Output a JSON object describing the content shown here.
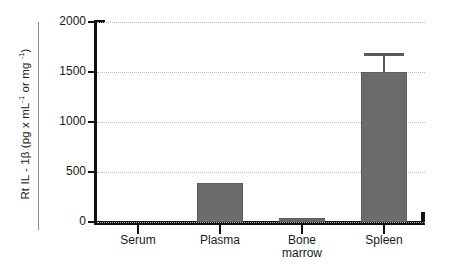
{
  "chart_data": {
    "type": "bar",
    "title": "",
    "subtitle": "",
    "xlabel": "",
    "ylabel": "Rt IL - 1β  (pg x mL⁻¹ or mg ⁻¹)",
    "ylabel_parts": {
      "main": "Rt IL - 1β  (pg x mL",
      "sup1": "-1",
      "mid": " or mg ",
      "sup2": "-1",
      "tail": ")"
    },
    "categories": [
      "Serum",
      "Plasma",
      "Bone\nmarrow",
      "Spleen"
    ],
    "category_labels": [
      {
        "line1": "Serum",
        "line2": ""
      },
      {
        "line1": "Plasma",
        "line2": ""
      },
      {
        "line1": "Bone",
        "line2": "marrow"
      },
      {
        "line1": "Spleen",
        "line2": ""
      }
    ],
    "values": [
      0,
      390,
      40,
      1500
    ],
    "errors": [
      0,
      0,
      0,
      190
    ],
    "ylim": [
      0,
      2000
    ],
    "yticks": [
      0,
      500,
      1000,
      1500,
      2000
    ],
    "ytick_labels": [
      "0",
      "500",
      "1000",
      "1500",
      "2000"
    ],
    "grid": true,
    "grid_style": "dotted",
    "legend": "none",
    "bar_color": "#6b6b6b",
    "error_color": "#5a5a5a",
    "axis_color": "#111111",
    "grid_color": "#b9b9b9",
    "background": "#ffffff"
  }
}
